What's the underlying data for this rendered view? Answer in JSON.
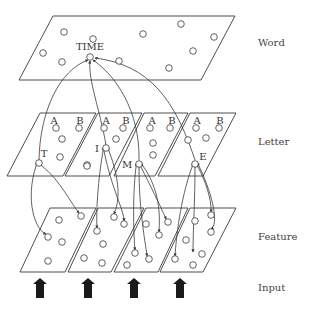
{
  "diagram": {
    "type": "interactive-activation-model",
    "layers": [
      {
        "id": "word",
        "label": "Word",
        "label_pos": [
          258,
          46
        ]
      },
      {
        "id": "letter",
        "label": "Letter",
        "label_pos": [
          258,
          145
        ]
      },
      {
        "id": "feature",
        "label": "Feature",
        "label_pos": [
          258,
          240
        ]
      },
      {
        "id": "input",
        "label": "Input",
        "label_pos": [
          258,
          291
        ]
      }
    ],
    "word_plane": {
      "points": "53,16 235,16 201,80 19,80",
      "nodes": [
        [
          64,
          32
        ],
        [
          93,
          39
        ],
        [
          143,
          34
        ],
        [
          181,
          24
        ],
        [
          214,
          37
        ],
        [
          43,
          53
        ],
        [
          62,
          62
        ],
        [
          119,
          61
        ],
        [
          193,
          51
        ],
        [
          169,
          68
        ]
      ],
      "active_node": {
        "label": "TIME",
        "pos": [
          90,
          57
        ],
        "label_pos": [
          90,
          50
        ]
      }
    },
    "letter_planes": [
      {
        "points": "40,113 96,113 63,176 7,176",
        "slot_labels": [
          {
            "text": "A",
            "pos": [
              54,
              124
            ]
          },
          {
            "text": "B",
            "pos": [
              80,
              124
            ]
          }
        ],
        "nodes": [
          [
            56,
            128
          ],
          [
            79,
            128
          ],
          [
            62,
            139
          ],
          [
            60,
            157
          ],
          [
            87,
            165
          ]
        ],
        "active_node": {
          "label": "T",
          "pos": [
            39,
            163
          ],
          "label_pos": [
            44,
            157
          ]
        }
      },
      {
        "points": "98,113 142,113 109,176 65,176",
        "slot_labels": [
          {
            "text": "A",
            "pos": [
              106,
              124
            ]
          },
          {
            "text": "B",
            "pos": [
              126,
              124
            ]
          }
        ],
        "nodes": [
          [
            104,
            128
          ],
          [
            123,
            128
          ],
          [
            116,
            139
          ],
          [
            87,
            166
          ]
        ],
        "active_node": {
          "label": "I",
          "pos": [
            106,
            148
          ],
          "label_pos": [
            97,
            152
          ]
        }
      },
      {
        "points": "144,113 188,113 155,176 114,176",
        "slot_labels": [
          {
            "text": "A",
            "pos": [
              152,
              124
            ]
          },
          {
            "text": "B",
            "pos": [
              172,
              124
            ]
          }
        ],
        "nodes": [
          [
            150,
            128
          ],
          [
            170,
            128
          ],
          [
            153,
            143
          ],
          [
            153,
            155
          ]
        ],
        "active_node": {
          "label": "M",
          "pos": [
            139,
            164
          ],
          "label_pos": [
            127,
            168
          ]
        }
      },
      {
        "points": "190,113 236,113 203,176 158,176",
        "slot_labels": [
          {
            "text": "A",
            "pos": [
              197,
              124
            ]
          },
          {
            "text": "B",
            "pos": [
              220,
              124
            ]
          }
        ],
        "nodes": [
          [
            196,
            128
          ],
          [
            219,
            128
          ],
          [
            188,
            140
          ],
          [
            206,
            138
          ]
        ],
        "active_node": {
          "label": "E",
          "pos": [
            195,
            164
          ],
          "label_pos": [
            203,
            160
          ]
        }
      }
    ],
    "feature_planes": [
      {
        "points": "50,208 96,208 65,272 20,272",
        "nodes": [
          [
            59,
            220
          ],
          [
            81,
            216
          ],
          [
            48,
            237
          ],
          [
            62,
            242
          ],
          [
            48,
            261
          ]
        ]
      },
      {
        "points": "98,208 144,208 111,272 68,272",
        "nodes": [
          [
            97,
            231
          ],
          [
            114,
            217
          ],
          [
            103,
            244
          ],
          [
            84,
            258
          ],
          [
            102,
            263
          ],
          [
            124,
            224
          ]
        ]
      },
      {
        "points": "146,208 188,208 158,272 114,272",
        "nodes": [
          [
            146,
            224
          ],
          [
            168,
            222
          ],
          [
            159,
            235
          ],
          [
            135,
            253
          ],
          [
            149,
            259
          ],
          [
            127,
            265
          ]
        ]
      },
      {
        "points": "190,208 236,208 203,272 160,272",
        "nodes": [
          [
            195,
            221
          ],
          [
            211,
            215
          ],
          [
            211,
            232
          ],
          [
            186,
            240
          ],
          [
            175,
            259
          ],
          [
            202,
            254
          ],
          [
            193,
            265
          ]
        ]
      }
    ],
    "connections_to_word": [
      "M39,160 C40,110 60,70 88,60",
      "M106,145 C100,110 88,80 90,61",
      "M139,160 C140,110 115,75 93,60",
      "M195,160 C175,100 150,65 95,58"
    ],
    "connections_letter_to_feature": [
      "M36,166 C25,200 35,230 46,234",
      "M42,166 C60,180 72,205 79,213",
      "M103,151 C98,180 96,210 97,228",
      "M109,151 C120,180 120,200 114,214",
      "M104,151 C112,190 124,210 124,221",
      "M136,167 C132,200 134,240 135,250",
      "M139,168 C139,210 145,240 147,256",
      "M141,167 C150,185 160,205 166,219",
      "M143,166 C160,190 160,215 159,232",
      "M192,167 C180,200 176,240 175,256",
      "M195,168 C195,200 193,230 193,252",
      "M198,167 C205,180 212,200 211,212",
      "M199,166 C215,200 218,225 211,229"
    ],
    "input_arrows": [
      40,
      88,
      134,
      180
    ],
    "colors": {
      "stroke": "#3a3a3a",
      "arrow_fill": "#1a1a1a",
      "label": "#444444"
    }
  }
}
